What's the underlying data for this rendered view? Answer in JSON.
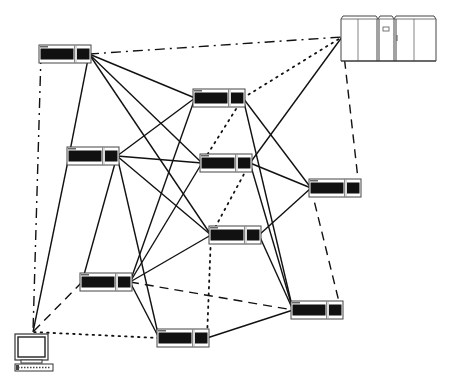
{
  "diagram": {
    "type": "network-topology",
    "colors": {
      "line": "#111111",
      "device_fill": "#111111",
      "background": "#ffffff"
    },
    "nodes": [
      {
        "id": "n1",
        "kind": "device",
        "x": 39,
        "y": 45
      },
      {
        "id": "n2",
        "kind": "device",
        "x": 193,
        "y": 89
      },
      {
        "id": "n3",
        "kind": "device",
        "x": 67,
        "y": 147
      },
      {
        "id": "n4",
        "kind": "device",
        "x": 200,
        "y": 154
      },
      {
        "id": "n5",
        "kind": "device",
        "x": 309,
        "y": 179
      },
      {
        "id": "n6",
        "kind": "device",
        "x": 209,
        "y": 226
      },
      {
        "id": "n7",
        "kind": "device",
        "x": 80,
        "y": 273
      },
      {
        "id": "n8",
        "kind": "device",
        "x": 157,
        "y": 329
      },
      {
        "id": "n9",
        "kind": "device",
        "x": 291,
        "y": 301
      },
      {
        "id": "mainframe",
        "kind": "mainframe",
        "x": 340,
        "y": 15
      },
      {
        "id": "terminal",
        "kind": "terminal",
        "x": 13,
        "y": 330
      }
    ],
    "edges": [
      {
        "from": "n1",
        "to": "n2",
        "style": "solid"
      },
      {
        "from": "n1",
        "to": "n3",
        "style": "solid"
      },
      {
        "from": "n1",
        "to": "n4",
        "style": "solid"
      },
      {
        "from": "n1",
        "to": "n6",
        "style": "solid"
      },
      {
        "from": "n1",
        "to": "mainframe",
        "style": "dash-dot"
      },
      {
        "from": "n1",
        "to": "terminal",
        "style": "dash-dot"
      },
      {
        "from": "n2",
        "to": "n3",
        "style": "solid"
      },
      {
        "from": "n2",
        "to": "n5",
        "style": "solid"
      },
      {
        "from": "n2",
        "to": "n7",
        "style": "solid"
      },
      {
        "from": "n2",
        "to": "n9",
        "style": "solid"
      },
      {
        "from": "n2",
        "to": "n4",
        "style": "dotted"
      },
      {
        "from": "n2",
        "to": "mainframe",
        "style": "dotted"
      },
      {
        "from": "n3",
        "to": "n4",
        "style": "solid"
      },
      {
        "from": "n3",
        "to": "n6",
        "style": "solid"
      },
      {
        "from": "n3",
        "to": "n7",
        "style": "solid"
      },
      {
        "from": "n3",
        "to": "n8",
        "style": "solid"
      },
      {
        "from": "n3",
        "to": "terminal",
        "style": "solid"
      },
      {
        "from": "n4",
        "to": "n5",
        "style": "solid"
      },
      {
        "from": "n4",
        "to": "n7",
        "style": "solid"
      },
      {
        "from": "n4",
        "to": "n9",
        "style": "solid"
      },
      {
        "from": "n4",
        "to": "n6",
        "style": "dotted"
      },
      {
        "from": "n4",
        "to": "mainframe",
        "style": "solid"
      },
      {
        "from": "n5",
        "to": "n6",
        "style": "solid"
      },
      {
        "from": "n5",
        "to": "mainframe",
        "style": "dashed"
      },
      {
        "from": "n5",
        "to": "n9",
        "style": "dashed"
      },
      {
        "from": "n6",
        "to": "n7",
        "style": "solid"
      },
      {
        "from": "n6",
        "to": "n9",
        "style": "solid"
      },
      {
        "from": "n6",
        "to": "n8",
        "style": "dotted"
      },
      {
        "from": "n7",
        "to": "n8",
        "style": "solid"
      },
      {
        "from": "n7",
        "to": "n9",
        "style": "dashed"
      },
      {
        "from": "n7",
        "to": "terminal",
        "style": "dashed"
      },
      {
        "from": "n8",
        "to": "n9",
        "style": "solid"
      },
      {
        "from": "n8",
        "to": "terminal",
        "style": "dotted"
      }
    ]
  }
}
